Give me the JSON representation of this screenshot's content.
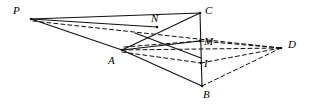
{
  "figure": {
    "width": 311,
    "height": 105,
    "background_color": "#ffffff",
    "stroke_color": "#111111",
    "labels": {
      "P": "P",
      "A": "A",
      "N": "N",
      "C": "C",
      "M": "M",
      "I": "I",
      "B": "B",
      "D": "D"
    },
    "points": [
      {
        "id": "P",
        "label": "P",
        "x": 31,
        "y": 19,
        "label_x": 13,
        "label_y": 5
      },
      {
        "id": "A",
        "label": "A",
        "x": 122,
        "y": 50,
        "label_x": 108,
        "label_y": 55
      },
      {
        "id": "N",
        "label": "N",
        "x": 157,
        "y": 27,
        "label_x": 151,
        "label_y": 13
      },
      {
        "id": "C",
        "label": "C",
        "x": 200,
        "y": 13,
        "label_x": 205,
        "label_y": 5
      },
      {
        "id": "M",
        "label": "M",
        "x": 200,
        "y": 41,
        "label_x": 204,
        "label_y": 36
      },
      {
        "id": "I",
        "label": "I",
        "x": 201,
        "y": 63,
        "label_x": 204,
        "label_y": 58
      },
      {
        "id": "B",
        "label": "B",
        "x": 202,
        "y": 86,
        "label_x": 203,
        "label_y": 89
      },
      {
        "id": "D",
        "label": "D",
        "x": 281,
        "y": 48,
        "label_x": 288,
        "label_y": 39
      }
    ],
    "solid_segments": [
      {
        "name": "segment-P-C",
        "from": "P",
        "to": "C",
        "x1": 31,
        "y1": 19,
        "x2": 200,
        "y2": 13
      },
      {
        "name": "segment-P-A",
        "from": "P",
        "to": "A",
        "x1": 31,
        "y1": 19,
        "x2": 122,
        "y2": 50
      },
      {
        "name": "segment-A-C",
        "from": "A",
        "to": "C",
        "x1": 122,
        "y1": 50,
        "x2": 200,
        "y2": 13
      },
      {
        "name": "segment-A-M",
        "from": "A",
        "to": "M",
        "x1": 122,
        "y1": 50,
        "x2": 200,
        "y2": 41
      },
      {
        "name": "segment-A-B",
        "from": "A",
        "to": "B",
        "x1": 122,
        "y1": 50,
        "x2": 202,
        "y2": 86
      },
      {
        "name": "segment-C-B",
        "from": "C",
        "to": "B",
        "x1": 200,
        "y1": 13,
        "x2": 202,
        "y2": 86
      },
      {
        "name": "segment-N-B",
        "from": "N",
        "to": "B",
        "x1": 135,
        "y1": 33,
        "x2": 201,
        "y2": 58
      },
      {
        "name": "segment-P-N-extend",
        "from": "P",
        "to": "N",
        "x1": 31,
        "y1": 19,
        "x2": 157,
        "y2": 27
      }
    ],
    "dashed_segments": [
      {
        "name": "segment-P-D",
        "from": "P",
        "to": "D",
        "x1": 33,
        "y1": 21,
        "x2": 281,
        "y2": 48
      },
      {
        "name": "segment-A-D",
        "from": "A",
        "to": "D",
        "x1": 122,
        "y1": 50,
        "x2": 281,
        "y2": 48
      },
      {
        "name": "segment-A-I",
        "from": "A",
        "to": "I",
        "x1": 122,
        "y1": 52,
        "x2": 201,
        "y2": 63
      },
      {
        "name": "segment-M-D",
        "from": "M",
        "to": "D",
        "x1": 200,
        "y1": 41,
        "x2": 281,
        "y2": 48
      },
      {
        "name": "segment-I-D",
        "from": "I",
        "to": "D",
        "x1": 201,
        "y1": 63,
        "x2": 281,
        "y2": 48
      },
      {
        "name": "segment-B-D",
        "from": "B",
        "to": "D",
        "x1": 202,
        "y1": 86,
        "x2": 281,
        "y2": 48
      },
      {
        "name": "segment-A-M-dashed",
        "from": "A",
        "to": "M",
        "x1": 124,
        "y1": 47,
        "x2": 200,
        "y2": 41
      }
    ]
  }
}
